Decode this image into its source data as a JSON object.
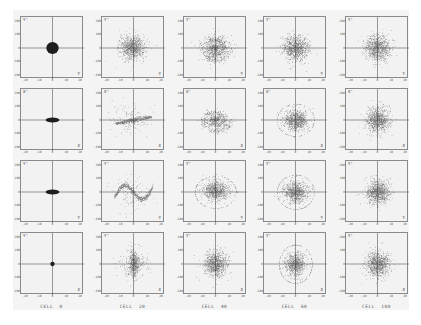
{
  "figure": {
    "columns": [
      "CELL  0",
      "CELL  20",
      "CELL  40",
      "CELL  60",
      "CELL  100"
    ],
    "rows": [
      {
        "y_label": "Y'",
        "x_label": "Y"
      },
      {
        "y_label": "X'",
        "x_label": "X"
      },
      {
        "y_label": "Y'",
        "x_label": "Y"
      },
      {
        "y_label": "Y'",
        "x_label": "X"
      }
    ],
    "y_ticks": [
      "200",
      "150",
      "100",
      "50",
      "0",
      "-50",
      "-100",
      "-150",
      "-200"
    ],
    "x_ticks": [
      "-20",
      "-15",
      "-10",
      "-5",
      "0",
      "5",
      "10",
      "15",
      "20"
    ],
    "colors": {
      "background": "#f2f2f2",
      "frame": "#8a8a8a",
      "points": "#1e1e1e",
      "axis": "#555555"
    }
  },
  "chart_data": {
    "type": "scatter",
    "title": "",
    "layout": {
      "grid_rows": 4,
      "grid_cols": 5,
      "axes_cross_at_origin": true,
      "grid": false,
      "legend": "none"
    },
    "columns": [
      "CELL 0",
      "CELL 20",
      "CELL 40",
      "CELL 60",
      "CELL 100"
    ],
    "xlim": [
      -20,
      20
    ],
    "ylim": [
      -200,
      200
    ],
    "panels": [
      {
        "row": 0,
        "col": 0,
        "shape": "filled-circle",
        "cx": 0,
        "cy": 0,
        "rx": 4.5,
        "ry": 45,
        "spread": 0
      },
      {
        "row": 0,
        "col": 1,
        "shape": "cloud",
        "cx": -1,
        "cy": 5,
        "rx": 10,
        "ry": 95,
        "density": "high"
      },
      {
        "row": 0,
        "col": 2,
        "shape": "cloud-spiral",
        "cx": -1,
        "cy": 5,
        "rx": 11,
        "ry": 100,
        "density": "high"
      },
      {
        "row": 0,
        "col": 3,
        "shape": "cloud",
        "cx": 0,
        "cy": 0,
        "rx": 10,
        "ry": 100,
        "density": "high"
      },
      {
        "row": 0,
        "col": 4,
        "shape": "cloud",
        "cx": 0,
        "cy": 0,
        "rx": 10,
        "ry": 100,
        "density": "high"
      },
      {
        "row": 1,
        "col": 0,
        "shape": "filled-ellipse",
        "cx": 0,
        "cy": 0,
        "rx": 5,
        "ry": 18,
        "spread": 0
      },
      {
        "row": 1,
        "col": 1,
        "shape": "filament-horizontal",
        "cx": 0,
        "cy": 0,
        "rx": 13,
        "ry": 60,
        "density": "medium"
      },
      {
        "row": 1,
        "col": 2,
        "shape": "spiral",
        "cx": 0,
        "cy": 0,
        "rx": 11,
        "ry": 90,
        "density": "medium"
      },
      {
        "row": 1,
        "col": 3,
        "shape": "cloud-halo",
        "cx": 0,
        "cy": 0,
        "rx": 9,
        "ry": 80,
        "density": "high"
      },
      {
        "row": 1,
        "col": 4,
        "shape": "cloud",
        "cx": 0,
        "cy": 0,
        "rx": 9,
        "ry": 95,
        "density": "high"
      },
      {
        "row": 2,
        "col": 0,
        "shape": "filled-ellipse",
        "cx": 0,
        "cy": 0,
        "rx": 5,
        "ry": 18,
        "spread": 0
      },
      {
        "row": 2,
        "col": 1,
        "shape": "s-filament",
        "cx": 0,
        "cy": 0,
        "rx": 14,
        "ry": 120,
        "density": "medium"
      },
      {
        "row": 2,
        "col": 2,
        "shape": "cloud-halo",
        "cx": 0,
        "cy": 10,
        "rx": 10,
        "ry": 80,
        "density": "high"
      },
      {
        "row": 2,
        "col": 3,
        "shape": "cloud-halo",
        "cx": 0,
        "cy": 0,
        "rx": 9,
        "ry": 85,
        "density": "high"
      },
      {
        "row": 2,
        "col": 4,
        "shape": "cloud",
        "cx": 0,
        "cy": 0,
        "rx": 9,
        "ry": 95,
        "density": "high"
      },
      {
        "row": 3,
        "col": 0,
        "shape": "filled-circle",
        "cx": 0,
        "cy": 0,
        "rx": 1.6,
        "ry": 16,
        "spread": 0
      },
      {
        "row": 3,
        "col": 1,
        "shape": "vertical-core",
        "cx": 0,
        "cy": 0,
        "rx": 6,
        "ry": 110,
        "density": "medium"
      },
      {
        "row": 3,
        "col": 2,
        "shape": "cloud",
        "cx": 0,
        "cy": 0,
        "rx": 9,
        "ry": 100,
        "density": "high"
      },
      {
        "row": 3,
        "col": 3,
        "shape": "cloud-halo",
        "cx": 0,
        "cy": 0,
        "rx": 8,
        "ry": 95,
        "density": "high"
      },
      {
        "row": 3,
        "col": 4,
        "shape": "cloud",
        "cx": 0,
        "cy": 0,
        "rx": 9,
        "ry": 100,
        "density": "high"
      }
    ]
  }
}
